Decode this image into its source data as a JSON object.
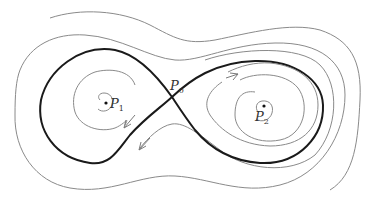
{
  "diagram": {
    "type": "phase-portrait",
    "colors": {
      "separatrix": "#1a1a1a",
      "level_curves": "#8a8a8a",
      "arrows": "#7a7a7a",
      "background": "#ffffff"
    },
    "points": [
      {
        "id": "P0",
        "label": "P",
        "sub": "0",
        "role": "saddle"
      },
      {
        "id": "P1",
        "label": "P",
        "sub": "1",
        "role": "center"
      },
      {
        "id": "P2",
        "label": "P",
        "sub": "2",
        "role": "center"
      }
    ]
  }
}
